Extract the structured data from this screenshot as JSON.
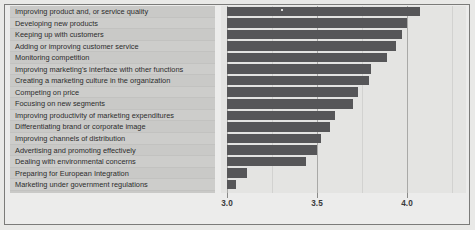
{
  "chart_data": {
    "type": "bar",
    "orientation": "horizontal",
    "title": "",
    "subtitle": "",
    "xlabel": "",
    "ylabel": "",
    "xlim": [
      3.0,
      4.3
    ],
    "grid": true,
    "legend": false,
    "bar_color": "#565658",
    "panel_color": "#c9c9c7",
    "plot_bg": "#e4e4e2",
    "xticks": [
      3.0,
      3.5,
      4.0
    ],
    "xtick_labels": [
      "3.0",
      "3.5",
      "4.0"
    ],
    "gridline_values": [
      3.0,
      3.25,
      3.5,
      3.75,
      4.0,
      4.25
    ],
    "categories": [
      "Improving product and, or service quality",
      "Developing new products",
      "Keeping up with customers",
      "Adding or improving customer service",
      "Monitoring competition",
      "Improving marketing's interface with other functions",
      "Creating a marketing culture in the organization",
      "Competing on price",
      "Focusing on new segments",
      "Improving productivity of marketing expenditures",
      "Differentiating brand or corporate image",
      "Improving channels of distribution",
      "Advertising and promoting effectively",
      "Dealing with environmental concerns",
      "Preparing for European Integration",
      "Marketing under government regulations"
    ],
    "values": [
      4.07,
      4.0,
      3.97,
      3.94,
      3.89,
      3.8,
      3.79,
      3.73,
      3.7,
      3.6,
      3.57,
      3.52,
      3.5,
      3.44,
      3.11,
      3.05
    ]
  }
}
